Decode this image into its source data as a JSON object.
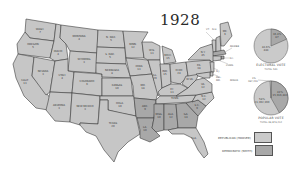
{
  "title": "1928",
  "colors": {
    "republican": "#cacaca",
    "democratic": "#a8a8a8",
    "other": "#e4e4e4",
    "border": "#3c3c3c",
    "background": "#ffffff"
  },
  "states": [
    {
      "name": "WASH.",
      "ev": "7",
      "party": "republican"
    },
    {
      "name": "OREGON",
      "ev": "5",
      "party": "republican"
    },
    {
      "name": "CALIF.",
      "ev": "13",
      "party": "republican"
    },
    {
      "name": "NEVADA",
      "ev": "3",
      "party": "republican"
    },
    {
      "name": "IDAHO",
      "ev": "4",
      "party": "republican"
    },
    {
      "name": "MONTANA",
      "ev": "4",
      "party": "republican"
    },
    {
      "name": "WYOMING",
      "ev": "3",
      "party": "republican"
    },
    {
      "name": "UTAH",
      "ev": "4",
      "party": "republican"
    },
    {
      "name": "ARIZONA",
      "ev": "3",
      "party": "republican"
    },
    {
      "name": "COLORADO",
      "ev": "6",
      "party": "republican"
    },
    {
      "name": "NEW MEXICO",
      "ev": "3",
      "party": "republican"
    },
    {
      "name": "N. DAK.",
      "ev": "5",
      "party": "republican"
    },
    {
      "name": "S. DAK.",
      "ev": "5",
      "party": "republican"
    },
    {
      "name": "NEBRASKA",
      "ev": "8",
      "party": "republican"
    },
    {
      "name": "KANSAS",
      "ev": "10",
      "party": "republican"
    },
    {
      "name": "OKLA.",
      "ev": "10",
      "party": "republican"
    },
    {
      "name": "TEXAS",
      "ev": "20",
      "party": "republican"
    },
    {
      "name": "MINN.",
      "ev": "12",
      "party": "republican"
    },
    {
      "name": "IOWA",
      "ev": "13",
      "party": "republican"
    },
    {
      "name": "MO.",
      "ev": "18",
      "party": "republican"
    },
    {
      "name": "ARK.",
      "ev": "9",
      "party": "democratic"
    },
    {
      "name": "LA.",
      "ev": "10",
      "party": "democratic"
    },
    {
      "name": "WIS.",
      "ev": "13",
      "party": "republican"
    },
    {
      "name": "ILL.",
      "ev": "29",
      "party": "republican"
    },
    {
      "name": "MICH.",
      "ev": "15",
      "party": "republican"
    },
    {
      "name": "IND.",
      "ev": "15",
      "party": "republican"
    },
    {
      "name": "OHIO",
      "ev": "24",
      "party": "republican"
    },
    {
      "name": "KY.",
      "ev": "13",
      "party": "republican"
    },
    {
      "name": "TENN.",
      "ev": "12",
      "party": "republican"
    },
    {
      "name": "MISS.",
      "ev": "10",
      "party": "democratic"
    },
    {
      "name": "ALA.",
      "ev": "12",
      "party": "democratic"
    },
    {
      "name": "GA.",
      "ev": "14",
      "party": "democratic"
    },
    {
      "name": "FLA.",
      "ev": "6",
      "party": "republican"
    },
    {
      "name": "S.C.",
      "ev": "9",
      "party": "democratic"
    },
    {
      "name": "N.C.",
      "ev": "12",
      "party": "republican"
    },
    {
      "name": "VA.",
      "ev": "12",
      "party": "republican"
    },
    {
      "name": "W.VA.",
      "ev": "8",
      "party": "republican"
    },
    {
      "name": "PA.",
      "ev": "38",
      "party": "republican"
    },
    {
      "name": "N.Y.",
      "ev": "45",
      "party": "republican"
    },
    {
      "name": "VT.",
      "ev": "4",
      "party": "republican"
    },
    {
      "name": "N.H.",
      "ev": "4",
      "party": "republican"
    },
    {
      "name": "ME.",
      "ev": "6",
      "party": "republican"
    },
    {
      "name": "MASS.",
      "ev": "18",
      "party": "democratic"
    },
    {
      "name": "R.I.",
      "ev": "5",
      "party": "democratic"
    },
    {
      "name": "CONN.",
      "ev": "8",
      "party": "republican"
    },
    {
      "name": "N.J.",
      "ev": "14",
      "party": "republican"
    },
    {
      "name": "DEL.",
      "ev": "3",
      "party": "republican"
    },
    {
      "name": "MD.",
      "ev": "8",
      "party": "republican"
    }
  ],
  "electoral_vote": {
    "caption": "ELECTORAL VOTE",
    "total_label": "TOTAL 531",
    "slices": [
      {
        "label": "83.6%",
        "value_label": "444",
        "party": "republican",
        "percent": 83.6
      },
      {
        "label": "16.4%",
        "value_label": "87",
        "party": "democratic",
        "percent": 16.4
      }
    ]
  },
  "popular_vote": {
    "caption": "POPULAR VOTE",
    "total_label": "TOTAL 36,879,414",
    "other_label": "MINOR",
    "other_pct_label": "1%",
    "other_value_label": "267,420",
    "slices": [
      {
        "label": "58%",
        "value_label": "21,392,190",
        "party": "republican",
        "percent": 58
      },
      {
        "label": "41%",
        "value_label": "15,016,443",
        "party": "democratic",
        "percent": 41
      },
      {
        "label": "1%",
        "value_label": "267,420",
        "party": "other",
        "percent": 1
      }
    ]
  },
  "legend": [
    {
      "label": "REPUBLICAN (HOOVER)",
      "party": "republican"
    },
    {
      "label": "DEMOCRATIC (SMITH)",
      "party": "democratic"
    }
  ]
}
